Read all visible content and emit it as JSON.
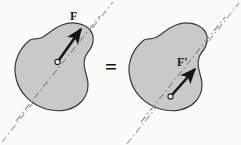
{
  "figure": {
    "background_color": "#fbfbfa",
    "equals_symbol": "=",
    "panels": [
      {
        "id": "left",
        "body_name": "rigid-body",
        "fill_color": "#c9c9c9",
        "stroke_color": "#3a3a3a",
        "force": {
          "label": "F",
          "color": "#151515",
          "tail": [
            57,
            62
          ],
          "head": [
            83,
            26
          ],
          "application_point": [
            57,
            62
          ]
        },
        "line_of_action": {
          "style": "dash-dot",
          "color": "#a89a94",
          "from": [
            2,
            142
          ],
          "to": [
            113,
            2
          ]
        }
      },
      {
        "id": "right",
        "body_name": "rigid-body",
        "fill_color": "#c9c9c9",
        "stroke_color": "#3a3a3a",
        "force": {
          "label": "F'",
          "color": "#151515",
          "tail": [
            170,
            97
          ],
          "head": [
            197,
            66
          ],
          "application_point": [
            170,
            97
          ]
        },
        "line_of_action": {
          "style": "dash-dot",
          "color": "#a89a94",
          "from": [
            127,
            144
          ],
          "to": [
            239,
            3
          ]
        }
      }
    ]
  }
}
